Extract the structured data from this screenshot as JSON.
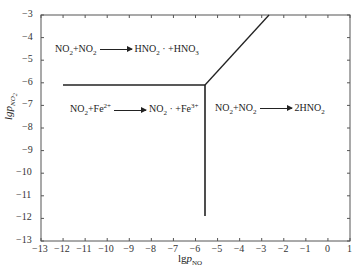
{
  "chart_data": {
    "type": "line",
    "title": "",
    "xlabel": "lgp_NO",
    "ylabel": "lgp_NO2",
    "xlim": [
      -13,
      1
    ],
    "ylim": [
      -13,
      -3
    ],
    "x_ticks": [
      "-13",
      "-12",
      "-11",
      "-10",
      "-9",
      "-8",
      "-7",
      "-6",
      "-5",
      "-4",
      "-3",
      "-2",
      "-1",
      "0",
      "1"
    ],
    "y_ticks": [
      "-3",
      "-4",
      "-5",
      "-6",
      "-7",
      "-8",
      "-9",
      "-10",
      "-11",
      "-12",
      "-13"
    ],
    "grid": false,
    "series": [
      {
        "name": "horizontal-boundary",
        "points": [
          [
            -12,
            -6.1
          ],
          [
            -5.6,
            -6.1
          ]
        ]
      },
      {
        "name": "vertical-boundary",
        "points": [
          [
            -5.6,
            -6.1
          ],
          [
            -5.6,
            -11.9
          ]
        ]
      },
      {
        "name": "diagonal-boundary",
        "points": [
          [
            -5.6,
            -6.1
          ],
          [
            -2.7,
            -3
          ]
        ]
      }
    ],
    "regions": [
      {
        "label": "NO2+NO2 → HNO2· +HNO3",
        "x": -12.5,
        "y": -4.5
      },
      {
        "label": "NO2+Fe2+ → NO2· +Fe3+",
        "x": -11.8,
        "y": -7.6
      },
      {
        "label": "NO2+NO2 → 2HNO2",
        "x": -4.7,
        "y": -7.6
      }
    ]
  },
  "labels": {
    "r1a": "NO",
    "r1b": "2",
    "r1c": "+NO",
    "r1d": "2",
    "r1e": "HNO",
    "r1f": "2",
    "r1g": " · +HNO",
    "r1h": "3",
    "r2a": "NO",
    "r2b": "2",
    "r2c": "+Fe",
    "r2d": "2+",
    "r2e": "NO",
    "r2f": "2",
    "r2g": " · +Fe",
    "r2h": "3+",
    "r3a": "NO",
    "r3b": "2",
    "r3c": "+NO",
    "r3d": "2",
    "r3e": "2HNO",
    "r3f": "2",
    "xlab_a": "lg",
    "xlab_b": "p",
    "xlab_c": "NO",
    "ylab_a": "lg",
    "ylab_b": "p",
    "ylab_c": "NO",
    "ylab_d": "2"
  }
}
